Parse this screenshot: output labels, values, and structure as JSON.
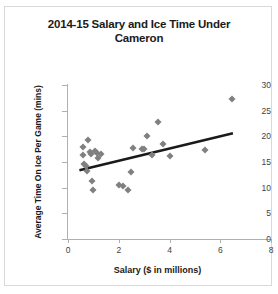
{
  "chart_data": {
    "type": "scatter",
    "title": "2014-15 Salary and Ice Time Under Cameron",
    "xlabel": "Salary ($ in millions)",
    "ylabel": "Average Time On Ice Per Game (mins)",
    "xlim": [
      0,
      8
    ],
    "ylim": [
      0,
      30
    ],
    "xticks": [
      0,
      2,
      4,
      6,
      8
    ],
    "yticks": [
      0,
      5,
      10,
      15,
      20,
      25,
      30
    ],
    "grid": false,
    "legend": "none",
    "marker_color": "#808080",
    "marker_shape": "diamond",
    "trendline_color": "#1a1a1a",
    "points": [
      {
        "x": 0.6,
        "y": 18.0
      },
      {
        "x": 0.6,
        "y": 16.3
      },
      {
        "x": 0.65,
        "y": 14.7
      },
      {
        "x": 0.7,
        "y": 14.2
      },
      {
        "x": 0.75,
        "y": 13.3
      },
      {
        "x": 0.8,
        "y": 19.3
      },
      {
        "x": 0.85,
        "y": 16.9
      },
      {
        "x": 0.9,
        "y": 16.5
      },
      {
        "x": 0.95,
        "y": 11.3
      },
      {
        "x": 1.0,
        "y": 9.6
      },
      {
        "x": 1.05,
        "y": 17.2
      },
      {
        "x": 1.15,
        "y": 16.7
      },
      {
        "x": 1.2,
        "y": 15.8
      },
      {
        "x": 1.3,
        "y": 16.6
      },
      {
        "x": 2.0,
        "y": 10.6
      },
      {
        "x": 2.15,
        "y": 10.4
      },
      {
        "x": 2.35,
        "y": 9.5
      },
      {
        "x": 2.5,
        "y": 13.0
      },
      {
        "x": 2.55,
        "y": 17.8
      },
      {
        "x": 2.9,
        "y": 17.6
      },
      {
        "x": 3.0,
        "y": 17.5
      },
      {
        "x": 3.1,
        "y": 20.0
      },
      {
        "x": 3.3,
        "y": 16.4
      },
      {
        "x": 3.55,
        "y": 22.8
      },
      {
        "x": 3.75,
        "y": 18.6
      },
      {
        "x": 4.0,
        "y": 16.2
      },
      {
        "x": 5.4,
        "y": 17.4
      },
      {
        "x": 6.45,
        "y": 27.2
      }
    ],
    "trendline": {
      "x0": 0.45,
      "y0": 13.4,
      "x1": 6.5,
      "y1": 20.6
    }
  }
}
